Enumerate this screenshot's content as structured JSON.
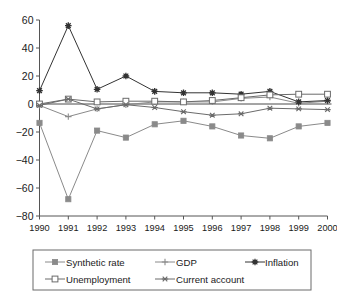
{
  "chart_data": {
    "type": "line",
    "title": "",
    "subtitle": "",
    "xlabel": "",
    "ylabel": "",
    "x": [
      1990,
      1991,
      1992,
      1993,
      1994,
      1995,
      1996,
      1997,
      1998,
      1999,
      2000
    ],
    "categories": [
      "1990",
      "1991",
      "1992",
      "1993",
      "1994",
      "1995",
      "1996",
      "1997",
      "1998",
      "1999",
      "2000"
    ],
    "xlim": [
      1990,
      2000
    ],
    "ylim": [
      -80,
      60
    ],
    "yticks": [
      -80,
      -60,
      -40,
      -20,
      0,
      20,
      40,
      60
    ],
    "ytick_labels": [
      "−80",
      "−60",
      "−40",
      "−20",
      "0",
      "20",
      "40",
      "60"
    ],
    "grid": false,
    "legend_position": "bottom",
    "series": [
      {
        "name": "Synthetic rate",
        "marker": "filled-square",
        "color": "#8a8a8a",
        "values": [
          -13.5,
          -68,
          -19,
          -24,
          -14.5,
          -12,
          -16,
          -22.5,
          -24.5,
          -16,
          -13.5
        ]
      },
      {
        "name": "GDP",
        "marker": "plus",
        "color": "#8a8a8a",
        "values": [
          -1,
          -9,
          -3.5,
          -0.5,
          1.5,
          1.5,
          1.5,
          4,
          5,
          0.5,
          2
        ]
      },
      {
        "name": "Inflation",
        "marker": "filled-star",
        "color": "#333333",
        "values": [
          9.5,
          56,
          10.5,
          20,
          9,
          8,
          8,
          7,
          9,
          1.5,
          2.5
        ]
      },
      {
        "name": "Unemployment",
        "marker": "open-square",
        "color": "#6b6b6b",
        "values": [
          0,
          3.5,
          1.5,
          2,
          2,
          1.5,
          2.5,
          4.5,
          6.5,
          7,
          7
        ]
      },
      {
        "name": "Current account",
        "marker": "x-star",
        "color": "#6b6b6b",
        "values": [
          -1,
          3.5,
          -3.5,
          -0.5,
          -2.5,
          -5.5,
          -8,
          -7,
          -3,
          -3.5,
          -4
        ]
      }
    ]
  },
  "legend": {
    "items": [
      {
        "label": "Synthetic rate"
      },
      {
        "label": "GDP"
      },
      {
        "label": "Inflation"
      },
      {
        "label": "Unemployment"
      },
      {
        "label": "Current account"
      }
    ]
  }
}
